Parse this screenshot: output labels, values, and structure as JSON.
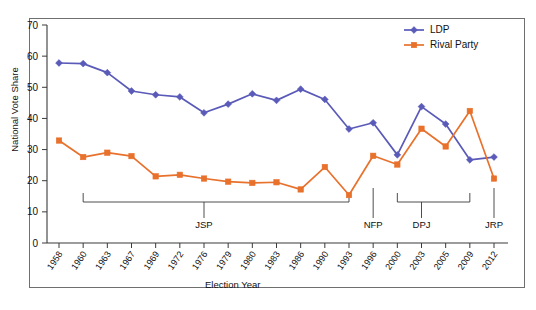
{
  "chart_data": {
    "type": "line",
    "title": "",
    "xlabel": "Election Year",
    "ylabel": "National Vote Share",
    "ylim": [
      0,
      70
    ],
    "yticks": [
      0,
      10,
      20,
      30,
      40,
      50,
      60,
      70
    ],
    "grid": false,
    "legend_position": "top-right",
    "categories": [
      "1958",
      "1960",
      "1963",
      "1967",
      "1969",
      "1972",
      "1976",
      "1979",
      "1980",
      "1983",
      "1986",
      "1990",
      "1993",
      "1996",
      "2000",
      "2003",
      "2005",
      "2009",
      "2012"
    ],
    "series": [
      {
        "name": "LDP",
        "color": "#5a5ab9",
        "marker": "diamond",
        "values": [
          57.8,
          57.6,
          54.7,
          48.8,
          47.6,
          46.9,
          41.8,
          44.6,
          47.9,
          45.8,
          49.4,
          46.1,
          36.6,
          38.6,
          28.3,
          43.8,
          38.2,
          26.7,
          27.6
        ]
      },
      {
        "name": "Rival Party",
        "color": "#e8712c",
        "marker": "square",
        "values": [
          32.9,
          27.6,
          29.0,
          27.9,
          21.4,
          21.9,
          20.7,
          19.7,
          19.3,
          19.5,
          17.2,
          24.4,
          15.4,
          28.0,
          25.2,
          36.7,
          31.0,
          42.4,
          20.7
        ]
      }
    ],
    "annotations": [
      {
        "label": "JSP",
        "type": "bracket",
        "start_category": "1960",
        "end_category": "1993",
        "tick_category": "1976"
      },
      {
        "label": "NFP",
        "type": "tick",
        "tick_category": "1996"
      },
      {
        "label": "DPJ",
        "type": "bracket",
        "start_category": "2000",
        "end_category": "2009",
        "tick_category": "2003"
      },
      {
        "label": "JRP",
        "type": "tick",
        "tick_category": "2012"
      }
    ]
  },
  "legend": {
    "items": [
      {
        "label": "LDP"
      },
      {
        "label": "Rival Party"
      }
    ]
  }
}
